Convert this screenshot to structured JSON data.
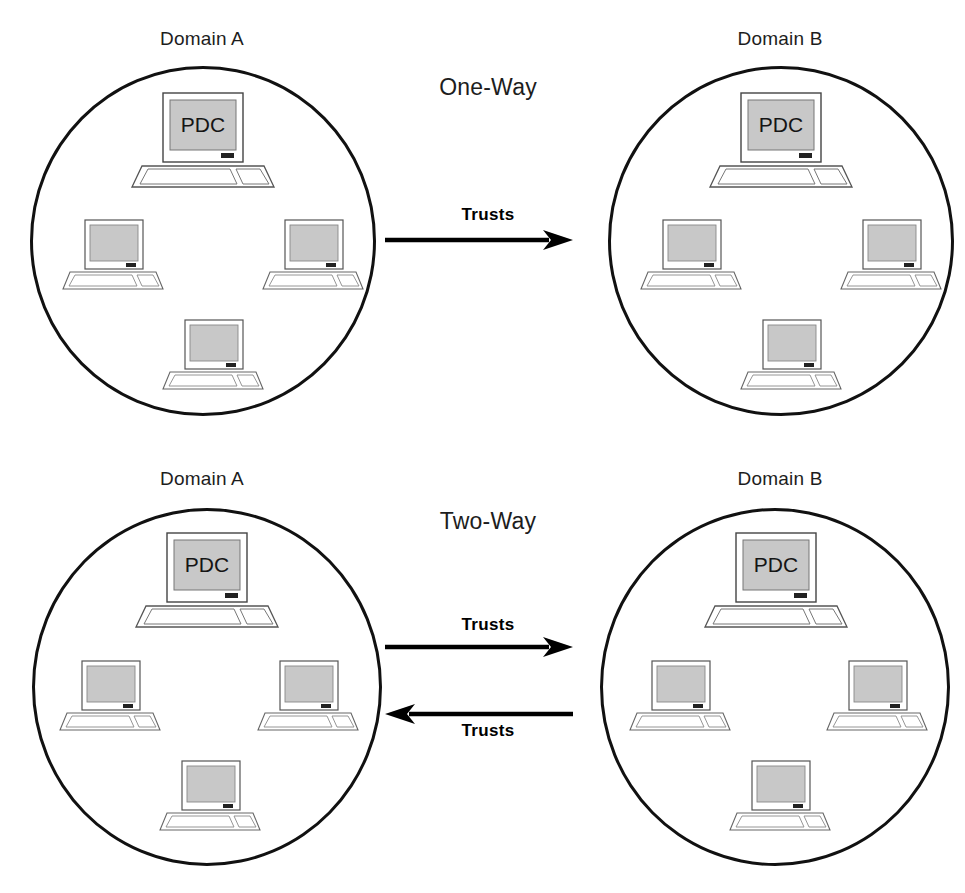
{
  "diagram": {
    "title_top": "One-Way",
    "title_bottom": "Two-Way",
    "label_pdc": "PDC",
    "label_trusts": "Trusts",
    "colors": {
      "outline": "#111111",
      "screen_fill": "#c8c8c8",
      "device_outline": "#555555",
      "arrow": "#000000",
      "text": "#1d1d1d"
    }
  },
  "sections": [
    {
      "id": "one-way",
      "mode_label": "One-Way",
      "domains": [
        {
          "id": "top-left",
          "label": "Domain A",
          "nodes": [
            {
              "role": "pdc",
              "label": "PDC"
            },
            {
              "role": "workstation",
              "label": ""
            },
            {
              "role": "workstation",
              "label": ""
            },
            {
              "role": "workstation",
              "label": ""
            }
          ]
        },
        {
          "id": "top-right",
          "label": "Domain B",
          "nodes": [
            {
              "role": "pdc",
              "label": "PDC"
            },
            {
              "role": "workstation",
              "label": ""
            },
            {
              "role": "workstation",
              "label": ""
            },
            {
              "role": "workstation",
              "label": ""
            }
          ]
        }
      ],
      "arrows": [
        {
          "id": "top-trust",
          "label": "Trusts",
          "direction": "right",
          "label_position": "above"
        }
      ]
    },
    {
      "id": "two-way",
      "mode_label": "Two-Way",
      "domains": [
        {
          "id": "bottom-left",
          "label": "Domain A",
          "nodes": [
            {
              "role": "pdc",
              "label": "PDC"
            },
            {
              "role": "workstation",
              "label": ""
            },
            {
              "role": "workstation",
              "label": ""
            },
            {
              "role": "workstation",
              "label": ""
            }
          ]
        },
        {
          "id": "bottom-right",
          "label": "Domain B",
          "nodes": [
            {
              "role": "pdc",
              "label": "PDC"
            },
            {
              "role": "workstation",
              "label": ""
            },
            {
              "role": "workstation",
              "label": ""
            },
            {
              "role": "workstation",
              "label": ""
            }
          ]
        }
      ],
      "arrows": [
        {
          "id": "bottom-trust-right",
          "label": "Trusts",
          "direction": "right",
          "label_position": "above"
        },
        {
          "id": "bottom-trust-left",
          "label": "Trusts",
          "direction": "left",
          "label_position": "below"
        }
      ]
    }
  ]
}
